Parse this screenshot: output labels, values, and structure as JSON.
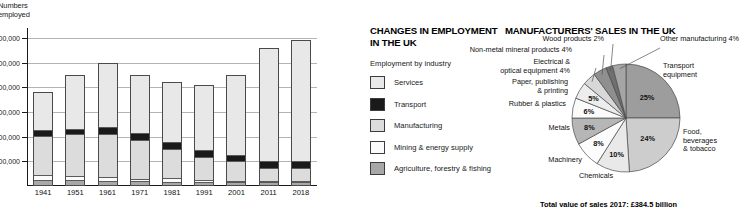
{
  "bar_chart": {
    "axis_title": "Numbers\nemployed",
    "y_tick_labels": [
      "30,000,000",
      "25,000,000",
      "20,000,000",
      "15,000,000",
      "10,000,000",
      "5,000,000"
    ],
    "y_tick_values": [
      30000000,
      25000000,
      20000000,
      15000000,
      10000000,
      5000000
    ]
  },
  "legend": {
    "title": "CHANGES IN EMPLOYMENT IN THE UK",
    "subtitle": "Employment by industry",
    "items": [
      {
        "label": "Services",
        "color": "#e8e8e8"
      },
      {
        "label": "Transport",
        "color": "#1a1a1a"
      },
      {
        "label": "Manufacturing",
        "color": "#dcdcdc"
      },
      {
        "label": "Mining & energy supply",
        "color": "#fbfbfb"
      },
      {
        "label": "Agriculture, forestry & fishing",
        "color": "#a8a8a8"
      }
    ]
  },
  "pie_panel": {
    "title": "MANUFACTURERS' SALES IN THE UK",
    "total_note": "Total value of sales 2017: £384.5 billion"
  },
  "chart_data": [
    {
      "type": "bar",
      "subtype": "stacked",
      "title": "CHANGES IN EMPLOYMENT IN THE UK",
      "xlabel": "",
      "ylabel": "Numbers employed",
      "ylim": [
        0,
        32000000
      ],
      "grid": true,
      "legend_position": "right",
      "categories": [
        "1941",
        "1951",
        "1961",
        "1971",
        "1981",
        "1991",
        "2001",
        "2011",
        "2018"
      ],
      "series": [
        {
          "name": "Agriculture, forestry & fishing",
          "color": "#a8a8a8",
          "values": [
            900000,
            800000,
            700000,
            600000,
            500000,
            450000,
            400000,
            400000,
            400000
          ]
        },
        {
          "name": "Mining & energy supply",
          "color": "#fbfbfb",
          "values": [
            900000,
            850000,
            800000,
            500000,
            700000,
            400000,
            250000,
            200000,
            180000
          ]
        },
        {
          "name": "Manufacturing",
          "color": "#dcdcdc",
          "values": [
            8200000,
            8600000,
            8700000,
            7900000,
            6100000,
            4800000,
            4000000,
            2700000,
            2600000
          ]
        },
        {
          "name": "Transport",
          "color": "#1a1a1a",
          "values": [
            1100000,
            1200000,
            1500000,
            1500000,
            1300000,
            1300000,
            1400000,
            1400000,
            1500000
          ]
        },
        {
          "name": "Services",
          "color": "#e8e8e8",
          "values": [
            7900000,
            11050000,
            13300000,
            12000000,
            12400000,
            13550000,
            16450000,
            23300000,
            24820000
          ]
        }
      ]
    },
    {
      "type": "pie",
      "title": "MANUFACTURERS' SALES IN THE UK",
      "annotation": "Total value of sales 2017: £384.5 billion",
      "unit": "%",
      "labels": [
        "Transport equipment",
        "Food, beverages & tobacco",
        "Chemicals",
        "Machinery",
        "Metals",
        "Rubber & plastics",
        "Paper, publishing & printing",
        "Electrical & optical equipment",
        "Non-metal mineral products",
        "Wood products",
        "Other manufacturing"
      ],
      "values": [
        25,
        24,
        10,
        8,
        8,
        6,
        5,
        4,
        4,
        2,
        4
      ],
      "display_values": [
        "25%",
        "24%",
        "10%",
        "8%",
        "8%",
        "6%",
        "5%",
        "4%",
        "4%",
        "2%",
        "4%"
      ],
      "colors": [
        "#9d9d9d",
        "#cdcdcd",
        "#e9e9e9",
        "#fcfcfc",
        "#b6b6b6",
        "#fbfbfb",
        "#ededed",
        "#d8d8d8",
        "#8f8f8f",
        "#6f6f6f",
        "#a5a5a5"
      ],
      "label_text": [
        "Transport\nequipment",
        "Food, beverages\n& tobacco",
        "Chemicals",
        "Machinery",
        "Metals",
        "Rubber & plastics",
        "Paper, publishing\n& printing",
        "Electrical &\noptical equipment 4%",
        "Non-metal mineral products 4%",
        "Wood products 2%",
        "Other manufacturing 4%"
      ]
    }
  ]
}
